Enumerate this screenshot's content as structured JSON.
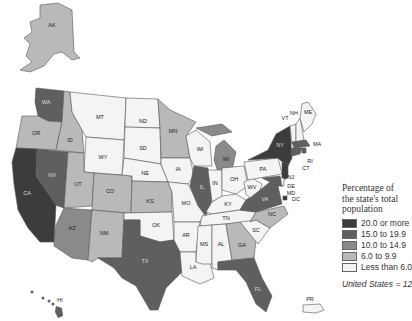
{
  "legend": {
    "title_line1": "Percentage of",
    "title_line2": "the state's total",
    "title_line3": "population",
    "classes": [
      {
        "label": "20.0 or more",
        "color": "#3c3c3c"
      },
      {
        "label": "15.0 to 19.9",
        "color": "#5f5f5f"
      },
      {
        "label": "10.0 to 14.9",
        "color": "#8a8a8a"
      },
      {
        "label": "6.0 to 9.9",
        "color": "#b9b9b9"
      },
      {
        "label": "Less than 6.0",
        "color": "#f4f4f4"
      }
    ],
    "total": "United States = 12.5"
  },
  "states": {
    "AK": "AK",
    "HI": "HI",
    "WA": "WA",
    "OR": "OR",
    "CA": "CA",
    "NV": "NV",
    "ID": "ID",
    "MT": "MT",
    "WY": "WY",
    "UT": "UT",
    "AZ": "AZ",
    "CO": "CO",
    "NM": "NM",
    "ND": "ND",
    "SD": "SD",
    "NE": "NE",
    "KS": "KS",
    "OK": "OK",
    "TX": "TX",
    "MN": "MN",
    "IA": "IA",
    "MO": "MO",
    "AR": "AR",
    "LA": "LA",
    "WI": "WI",
    "IL": "IL",
    "MI": "MI",
    "IN": "IN",
    "OH": "OH",
    "KY": "KY",
    "TN": "TN",
    "MS": "MS",
    "AL": "AL",
    "GA": "GA",
    "FL": "FL",
    "SC": "SC",
    "NC": "NC",
    "VA": "VA",
    "WV": "WV",
    "PA": "PA",
    "NY": "NY",
    "VT": "VT",
    "NH": "NH",
    "ME": "ME",
    "MA": "MA",
    "RI": "RI",
    "CT": "CT",
    "NJ": "NJ",
    "DE": "DE",
    "MD": "MD",
    "DC": "DC",
    "PR": "PR"
  }
}
